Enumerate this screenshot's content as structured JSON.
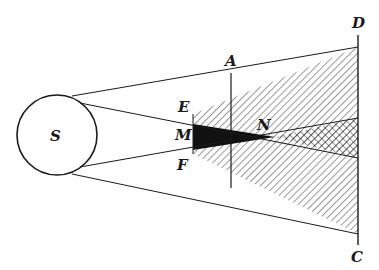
{
  "diagram": {
    "labels": {
      "source": "S",
      "top_edge": "E",
      "middle": "M",
      "bottom_edge": "F",
      "near_screen": "A",
      "far_screen_top": "D",
      "far_screen_bottom": "C",
      "umbra_apex": "N"
    },
    "colors": {
      "line": "#1a1a1a",
      "umbra": "#111111",
      "background": "#ffffff"
    }
  }
}
